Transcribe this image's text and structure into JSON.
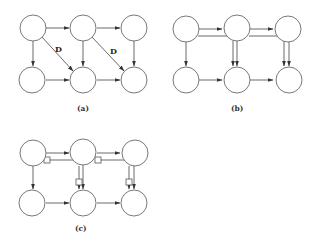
{
  "figure": {
    "panels": [
      {
        "id": "a",
        "caption": "(a)",
        "edge_labels": [
          "D",
          "D"
        ],
        "nodes": {
          "top": 3,
          "bottom": 3
        },
        "edges": [
          "top0->top1",
          "top1->top2",
          "bottom0->bottom1",
          "bottom1->bottom2",
          "top0->bottom0",
          "top1->bottom1",
          "top2->bottom2",
          "top0->bottom1 (D)",
          "top1->bottom2 (D)"
        ]
      },
      {
        "id": "b",
        "caption": "(b)",
        "nodes": {
          "top": 3,
          "bottom": 3
        },
        "edges": [
          "top0->top1",
          "top1->top2",
          "bottom0->bottom1",
          "bottom1->bottom2",
          "top0->bottom0",
          "top1->bottom1 (double)",
          "top2->bottom2 (double)",
          "top0->bottom1 (routed)",
          "top1->bottom2 (routed)"
        ]
      },
      {
        "id": "c",
        "caption": "(c)",
        "nodes": {
          "top": 3,
          "bottom": 3
        },
        "edges": [
          "top0->top1",
          "top1->top2",
          "bottom0->bottom1",
          "bottom1->bottom2",
          "top0->bottom0",
          "top1->bottom1 (double, with delay box)",
          "top2->bottom2 (double, with delay box)",
          "top0->bottom1 (routed, with delay box)",
          "top1->bottom2 (routed, with delay box)"
        ]
      }
    ]
  },
  "colors": {
    "node_stroke": "#6a6a6a",
    "edge": "#444444",
    "background": "#ffffff"
  }
}
